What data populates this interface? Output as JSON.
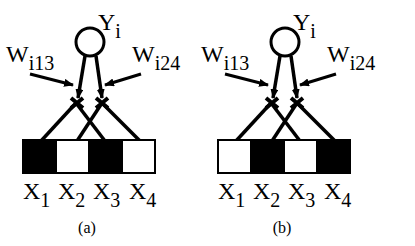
{
  "panels": [
    {
      "id": "a",
      "caption": "(a)",
      "output_node": {
        "label": "Y",
        "subscript": "i"
      },
      "weights": [
        {
          "label": "W",
          "subscript": "i13"
        },
        {
          "label": "W",
          "subscript": "i24"
        }
      ],
      "inputs": [
        {
          "label": "X",
          "subscript": "1",
          "state": "black"
        },
        {
          "label": "X",
          "subscript": "2",
          "state": "white"
        },
        {
          "label": "X",
          "subscript": "3",
          "state": "black"
        },
        {
          "label": "X",
          "subscript": "4",
          "state": "white"
        }
      ]
    },
    {
      "id": "b",
      "caption": "(b)",
      "output_node": {
        "label": "Y",
        "subscript": "i"
      },
      "weights": [
        {
          "label": "W",
          "subscript": "i13"
        },
        {
          "label": "W",
          "subscript": "i24"
        }
      ],
      "inputs": [
        {
          "label": "X",
          "subscript": "1",
          "state": "white"
        },
        {
          "label": "X",
          "subscript": "2",
          "state": "black"
        },
        {
          "label": "X",
          "subscript": "3",
          "state": "white"
        },
        {
          "label": "X",
          "subscript": "4",
          "state": "black"
        }
      ]
    }
  ],
  "colors": {
    "on": "#000000",
    "off": "#ffffff",
    "stroke": "#000000"
  }
}
